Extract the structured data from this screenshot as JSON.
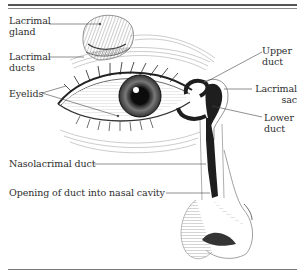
{
  "diagram": {
    "labels": {
      "lacrimal_gland": [
        "Lacrimal",
        "gland"
      ],
      "lacrimal_ducts": [
        "Lacrimal",
        "ducts"
      ],
      "eyelids": "Eyelids",
      "upper_duct": [
        "Upper",
        "duct"
      ],
      "lacrimal_sac": [
        "Lacrimal",
        "sac"
      ],
      "lower_duct": [
        "Lower",
        "duct"
      ],
      "nasolacrimal_duct": "Nasolacrimal duct",
      "opening": "Opening of duct into nasal cavity"
    },
    "colors": {
      "ink": "#2a2a2a",
      "duct_fill": "#1e1e1e",
      "rule": "#555555",
      "background": "#ffffff"
    }
  }
}
